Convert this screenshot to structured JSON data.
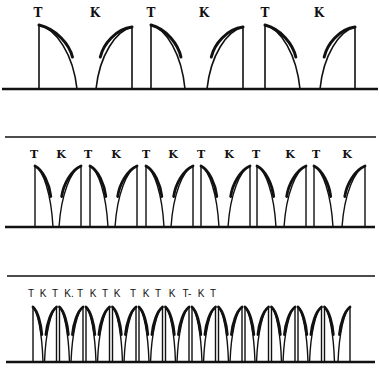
{
  "figure": {
    "width": 380,
    "height": 375,
    "background": "#ffffff",
    "ink": "#111111"
  },
  "panels": [
    {
      "id": "slow",
      "top_line": null,
      "baseline": {
        "y": 89,
        "x1": 2,
        "x2": 378
      },
      "pulse_top": 25,
      "label_y": 17,
      "label_size": 12,
      "label_style": "serif",
      "labels": [
        {
          "text": "T",
          "x": 38
        },
        {
          "text": "K",
          "x": 95
        },
        {
          "text": "T",
          "x": 151
        },
        {
          "text": "K",
          "x": 204
        },
        {
          "text": "T",
          "x": 265
        },
        {
          "text": "K",
          "x": 319
        }
      ],
      "pulses": [
        {
          "type": "T",
          "x": 39,
          "end": 77
        },
        {
          "type": "K",
          "start": 96,
          "x": 132
        },
        {
          "type": "T",
          "x": 151,
          "end": 185
        },
        {
          "type": "K",
          "start": 207,
          "x": 243
        },
        {
          "type": "T",
          "x": 265,
          "end": 300
        },
        {
          "type": "K",
          "start": 320,
          "x": 355
        }
      ]
    },
    {
      "id": "medium",
      "top_line": {
        "y": 137,
        "x1": 5,
        "x2": 376
      },
      "baseline": {
        "y": 227,
        "x1": 5,
        "x2": 375
      },
      "pulse_top": 166,
      "label_y": 158,
      "label_size": 11,
      "label_style": "serif",
      "labels": [
        {
          "text": "T",
          "x": 34
        },
        {
          "text": "K",
          "x": 61
        },
        {
          "text": "T",
          "x": 88
        },
        {
          "text": "K",
          "x": 116
        },
        {
          "text": "T",
          "x": 146
        },
        {
          "text": "K",
          "x": 173
        },
        {
          "text": "T",
          "x": 201
        },
        {
          "text": "K",
          "x": 229
        },
        {
          "text": "T",
          "x": 256
        },
        {
          "text": "K",
          "x": 290
        },
        {
          "text": "T",
          "x": 316
        },
        {
          "text": "K",
          "x": 347
        }
      ],
      "pulses": [
        {
          "type": "T",
          "x": 35,
          "end": 53
        },
        {
          "type": "K",
          "start": 59,
          "x": 81
        },
        {
          "type": "T",
          "x": 90,
          "end": 108
        },
        {
          "type": "K",
          "start": 115,
          "x": 137
        },
        {
          "type": "T",
          "x": 146,
          "end": 164
        },
        {
          "type": "K",
          "start": 171,
          "x": 193
        },
        {
          "type": "T",
          "x": 201,
          "end": 219
        },
        {
          "type": "K",
          "start": 228,
          "x": 250
        },
        {
          "type": "T",
          "x": 257,
          "end": 276
        },
        {
          "type": "K",
          "start": 284,
          "x": 306
        },
        {
          "type": "T",
          "x": 314,
          "end": 333
        },
        {
          "type": "K",
          "start": 342,
          "x": 365
        }
      ]
    },
    {
      "id": "fast",
      "top_line": {
        "y": 276,
        "x1": 7,
        "x2": 375
      },
      "baseline": {
        "y": 362,
        "x1": 6,
        "x2": 375
      },
      "pulse_top": 307,
      "label_y": 297,
      "label_size": 10,
      "label_style": "sans",
      "labels": [
        {
          "text": "T",
          "x": 31
        },
        {
          "text": "K",
          "x": 43
        },
        {
          "text": "T",
          "x": 55
        },
        {
          "text": "K.",
          "x": 69
        },
        {
          "text": "T",
          "x": 80
        },
        {
          "text": "K",
          "x": 93
        },
        {
          "text": "T",
          "x": 105
        },
        {
          "text": "K",
          "x": 117
        },
        {
          "text": "T",
          "x": 133
        },
        {
          "text": "K",
          "x": 146
        },
        {
          "text": "T",
          "x": 158
        },
        {
          "text": "K",
          "x": 172
        },
        {
          "text": "T-",
          "x": 187
        },
        {
          "text": "K",
          "x": 201
        },
        {
          "text": "T",
          "x": 213
        }
      ],
      "pulse_spacing": 26.5,
      "pulse_first_x": 33,
      "pulse_pairs": 12,
      "t_width": 10,
      "k_width": 12
    }
  ]
}
